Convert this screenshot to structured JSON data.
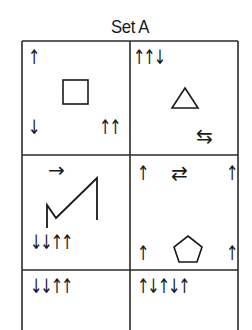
{
  "title": "Set A",
  "grid": {
    "rows": 3,
    "cols": 2,
    "cells": [
      {
        "row": 0,
        "col": 0,
        "shape": "square",
        "arrows": {
          "top_left": "↑",
          "bottom_left": "↓",
          "bottom_right": "↑↑"
        }
      },
      {
        "row": 0,
        "col": 1,
        "shape": "triangle",
        "arrows": {
          "top_left": "↑↑↓",
          "bottom_right": "⇆"
        }
      },
      {
        "row": 1,
        "col": 0,
        "shape": "zigzag-line",
        "arrows": {
          "top_center": "→",
          "bottom_left": "↓↓↑↑"
        }
      },
      {
        "row": 1,
        "col": 1,
        "shape": "pentagon",
        "arrows": {
          "top_left": "↑",
          "top_center": "⇄",
          "top_right": "↑",
          "bottom_left": "↑",
          "bottom_right": "↑"
        }
      },
      {
        "row": 2,
        "col": 0,
        "shape": "none",
        "arrows": {
          "top_left": "↓↓↑↑"
        }
      },
      {
        "row": 2,
        "col": 1,
        "shape": "none",
        "arrows": {
          "top_left": "↑↓↑↓↑"
        }
      }
    ]
  }
}
